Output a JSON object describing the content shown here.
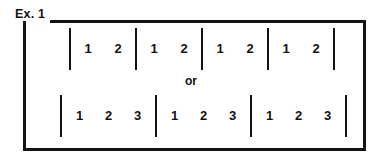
{
  "figure": {
    "label": "Ex. 1",
    "connector": "or",
    "ink_color": "#141414",
    "text_color": "#111111",
    "background_color": "#ffffff",
    "rows": [
      {
        "name": "duple-meter",
        "beats_per_measure": 2,
        "measure_count": 4,
        "barline_count": 5,
        "measures": [
          {
            "beats": [
              "1",
              "2"
            ]
          },
          {
            "beats": [
              "1",
              "2"
            ]
          },
          {
            "beats": [
              "1",
              "2"
            ]
          },
          {
            "beats": [
              "1",
              "2"
            ]
          }
        ]
      },
      {
        "name": "triple-meter",
        "beats_per_measure": 3,
        "measure_count": 3,
        "barline_count": 4,
        "measures": [
          {
            "beats": [
              "1",
              "2",
              "3"
            ]
          },
          {
            "beats": [
              "1",
              "2",
              "3"
            ]
          },
          {
            "beats": [
              "1",
              "2",
              "3"
            ]
          }
        ]
      }
    ]
  }
}
